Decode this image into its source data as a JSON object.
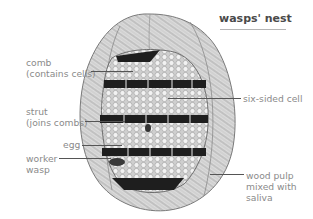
{
  "title": "wasps' nest",
  "labels": {
    "comb": [
      "comb",
      "(contains cells)"
    ],
    "strut": [
      "strut",
      "(joins combs)"
    ],
    "egg": "egg",
    "worker_wasp": [
      "worker",
      "wasp"
    ],
    "six_sided_cell": "six-sided cell",
    "wood_pulp": [
      "wood pulp",
      "mixed with",
      "saliva"
    ]
  },
  "colors": {
    "label_text": "#8a8a8a",
    "title_text": "#4a4a4a",
    "leader_line": "#555555",
    "nest_outer": "#d6d6d6",
    "comb_cells": "#e4e4e4",
    "gap_dark": "#1e1e1e"
  }
}
